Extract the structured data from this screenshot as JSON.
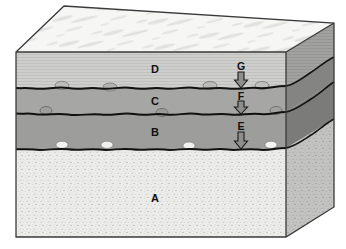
{
  "figure": {
    "type": "geologic-block-diagram",
    "title": "",
    "background_color": "#ffffff"
  },
  "layers": [
    {
      "id": "D",
      "label": "D",
      "label_x": 152,
      "label_y": 64,
      "role": "uppermost-unit",
      "texture": "thin-horizontal-laminations",
      "fill_color": "#c9c9c7",
      "front_top_y": 52,
      "front_bottom_y": 88
    },
    {
      "id": "C",
      "label": "C",
      "label_x": 152,
      "label_y": 96,
      "role": "second-unit",
      "texture": "uniform-medium-gray",
      "fill_color": "#a6a6a4",
      "front_top_y": 88,
      "front_bottom_y": 114
    },
    {
      "id": "B",
      "label": "B",
      "label_x": 152,
      "label_y": 127,
      "role": "third-unit",
      "texture": "uniform-medium-gray",
      "fill_color": "#9d9d9b",
      "front_top_y": 114,
      "front_bottom_y": 149
    },
    {
      "id": "A",
      "label": "A",
      "label_x": 152,
      "label_y": 193,
      "role": "basal-unit",
      "texture": "fine-speckled-granular",
      "fill_color": "#ececeb",
      "front_top_y": 149,
      "front_bottom_y": 237
    }
  ],
  "contacts": [
    {
      "id": "G",
      "label": "G",
      "label_x": 231,
      "label_y": 62,
      "arrow_x": 241,
      "arrow_top_y": 72,
      "arrow_bottom_y": 88,
      "between": "D-over-C",
      "marker": "down-arrow"
    },
    {
      "id": "F",
      "label": "F",
      "label_x": 231,
      "label_y": 92,
      "arrow_x": 241,
      "arrow_top_y": 101,
      "arrow_bottom_y": 114,
      "between": "C-over-B",
      "marker": "down-arrow"
    },
    {
      "id": "E",
      "label": "E",
      "label_x": 231,
      "label_y": 122,
      "arrow_x": 241,
      "arrow_top_y": 132,
      "arrow_bottom_y": 149,
      "between": "B-over-A",
      "marker": "down-arrow"
    }
  ],
  "clasts": {
    "description": "pebble inclusions resting on the contact surfaces",
    "contact_G": [
      {
        "x": 62,
        "y": 86,
        "rx": 7,
        "ry": 4,
        "fill": "#b9b9b6"
      },
      {
        "x": 110,
        "y": 87,
        "rx": 7,
        "ry": 4,
        "fill": "#b0b0ad"
      },
      {
        "x": 210,
        "y": 86,
        "rx": 7,
        "ry": 4,
        "fill": "#b7b7b4"
      },
      {
        "x": 262,
        "y": 86,
        "rx": 7,
        "ry": 4,
        "fill": "#bdbdba"
      }
    ],
    "contact_F": [
      {
        "x": 46,
        "y": 111,
        "rx": 6,
        "ry": 4,
        "fill": "#9a9a98"
      },
      {
        "x": 162,
        "y": 113,
        "rx": 6,
        "ry": 4,
        "fill": "#989896"
      },
      {
        "x": 276,
        "y": 111,
        "rx": 6,
        "ry": 4,
        "fill": "#9c9c9a"
      }
    ],
    "contact_E": [
      {
        "x": 62,
        "y": 145,
        "rx": 6,
        "ry": 3.5,
        "fill": "#f2f2f0"
      },
      {
        "x": 107,
        "y": 145,
        "rx": 6,
        "ry": 3.5,
        "fill": "#efefed"
      },
      {
        "x": 189,
        "y": 146,
        "rx": 6,
        "ry": 3.5,
        "fill": "#f0f0ee"
      },
      {
        "x": 271,
        "y": 145,
        "rx": 6,
        "ry": 3.5,
        "fill": "#f4f4f2"
      }
    ]
  },
  "top_surface": {
    "texture": "mottled-wispy-light",
    "fill_color": "#f3f3f2",
    "description": "exposed land surface of unit D"
  },
  "side_face": {
    "shading": "darker-shaded-right-side",
    "fill_tint": "#000000",
    "tint_opacity": 0.16
  },
  "geometry": {
    "front_left_x": 16,
    "front_right_x": 286,
    "back_right_x": 334,
    "top_back_y": 6,
    "bottom_front_y": 237,
    "bottom_back_y": 207,
    "outline_color": "#3a3a3a"
  },
  "palette": {
    "unit_D": "#c9c9c7",
    "unit_C": "#a6a6a4",
    "unit_B": "#9d9d9b",
    "unit_A": "#ececeb",
    "contact_line": "#111111",
    "label_text": "#111111"
  }
}
